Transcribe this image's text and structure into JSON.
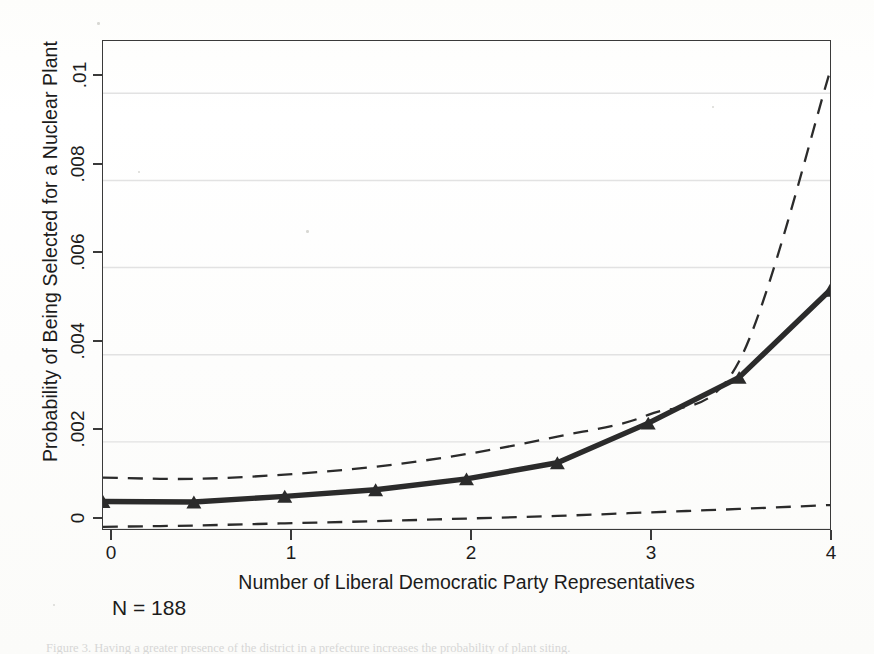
{
  "figure": {
    "caption_partial": "Figure 3.  Having a greater presence of the district in a prefecture increases the probability of plant siting."
  },
  "annotations": {
    "sample_size": "N = 188"
  },
  "axes": {
    "y_title": "Probability of Being Selected for a Nuclear Plant",
    "x_title": "Number of Liberal Democratic Party Representatives",
    "y_ticks": [
      "0",
      ".002",
      ".004",
      ".006",
      ".008",
      ".01"
    ],
    "x_ticks": [
      "0",
      "1",
      "2",
      "3",
      "4"
    ]
  },
  "colors": {
    "line": "#2b2b2b",
    "frame": "#3a3a3a",
    "grid": "#e2e2e2",
    "background": "#ffffff"
  },
  "chart_data": {
    "type": "line",
    "title": "",
    "xlabel": "Number of Liberal Democratic Party Representatives",
    "ylabel": "Probability of Being Selected for a Nuclear Plant",
    "xlim": [
      0,
      4
    ],
    "ylim": [
      0,
      0.0112
    ],
    "grid": true,
    "legend": "none",
    "xticks": [
      0,
      1,
      2,
      3,
      4
    ],
    "yticks": [
      0,
      0.002,
      0.004,
      0.006,
      0.008,
      0.01
    ],
    "x": [
      0,
      0.5,
      1,
      1.5,
      2,
      2.5,
      3,
      3.5,
      4
    ],
    "series": [
      {
        "name": "Predicted probability",
        "style": "solid",
        "marker": "triangle",
        "values": [
          0.00063,
          0.00062,
          0.00075,
          0.0009,
          0.00115,
          0.00152,
          0.00243,
          0.00348,
          0.00548
        ]
      },
      {
        "name": "Upper 95% confidence bound",
        "style": "dashed",
        "marker": "none",
        "values": [
          0.00118,
          0.00115,
          0.00125,
          0.00143,
          0.00172,
          0.00212,
          0.00262,
          0.00385,
          0.0105
        ]
      },
      {
        "name": "Lower 95% confidence bound",
        "style": "dashed",
        "marker": "none",
        "values": [
          5e-05,
          8e-05,
          0.00013,
          0.00018,
          0.00024,
          0.0003,
          0.00038,
          0.00046,
          0.00055
        ]
      }
    ]
  }
}
